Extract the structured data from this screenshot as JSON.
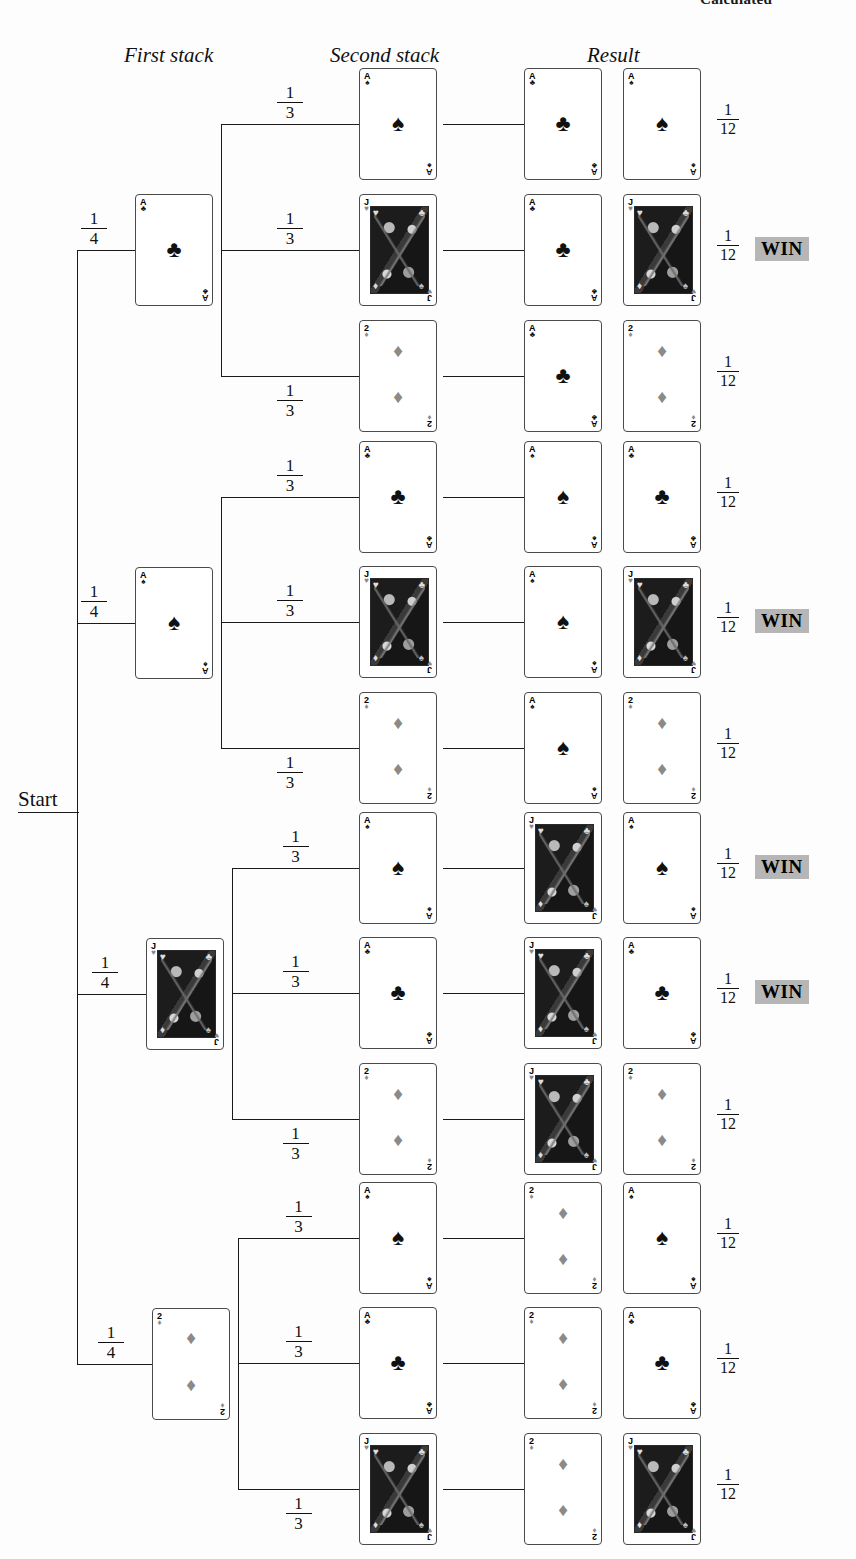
{
  "page_header": "Calculated",
  "columns": [
    {
      "label": "First stack",
      "x": 124,
      "y": 43
    },
    {
      "label": "Second stack",
      "x": 330,
      "y": 43
    },
    {
      "label": "Result",
      "x": 587,
      "y": 43
    }
  ],
  "start": {
    "label": "Start",
    "x": 18,
    "y": 787
  },
  "suits": {
    "spade": "♠",
    "club": "♣",
    "heart": "♥",
    "diamond": "♦"
  },
  "win": {
    "label": "WIN",
    "color": "#b6b6b6"
  },
  "branch_probability": {
    "numerator": "1",
    "denominator": "4"
  },
  "second_probability": {
    "numerator": "1",
    "denominator": "3"
  },
  "outcome_probability": {
    "numerator": "1",
    "denominator": "12"
  },
  "tree": {
    "total_outcomes": 12,
    "branches": [
      {
        "first_card": {
          "rank": "A",
          "suit": "club",
          "color": "black"
        },
        "probability": "1/4",
        "first_card_pos": {
          "x": 135,
          "y": 197
        },
        "prob_pos": {
          "x": 80,
          "y": 207
        },
        "children": [
          {
            "second_card": {
              "rank": "A",
              "suit": "spade",
              "color": "black"
            },
            "probability": "1/3",
            "result": [
              {
                "rank": "A",
                "suit": "club",
                "color": "black"
              },
              {
                "rank": "A",
                "suit": "spade",
                "color": "black"
              }
            ],
            "outcome_probability": "1/12",
            "win": false,
            "row_y": 68
          },
          {
            "second_card": {
              "rank": "J",
              "suit": "heart",
              "color": "face"
            },
            "probability": "1/3",
            "result": [
              {
                "rank": "A",
                "suit": "club",
                "color": "black"
              },
              {
                "rank": "J",
                "suit": "heart",
                "color": "face"
              }
            ],
            "outcome_probability": "1/12",
            "win": true,
            "row_y": 194
          },
          {
            "second_card": {
              "rank": "2",
              "suit": "diamond",
              "color": "gray"
            },
            "probability": "1/3",
            "result": [
              {
                "rank": "A",
                "suit": "club",
                "color": "black"
              },
              {
                "rank": "2",
                "suit": "diamond",
                "color": "gray"
              }
            ],
            "outcome_probability": "1/12",
            "win": false,
            "row_y": 320
          }
        ]
      },
      {
        "first_card": {
          "rank": "A",
          "suit": "spade",
          "color": "black"
        },
        "probability": "1/4",
        "first_card_pos": {
          "x": 135,
          "y": 568
        },
        "prob_pos": {
          "x": 80,
          "y": 578
        },
        "children": [
          {
            "second_card": {
              "rank": "A",
              "suit": "club",
              "color": "black"
            },
            "probability": "1/3",
            "result": [
              {
                "rank": "A",
                "suit": "spade",
                "color": "black"
              },
              {
                "rank": "A",
                "suit": "club",
                "color": "black"
              }
            ],
            "outcome_probability": "1/12",
            "win": false,
            "row_y": 441
          },
          {
            "second_card": {
              "rank": "J",
              "suit": "heart",
              "color": "face"
            },
            "probability": "1/3",
            "result": [
              {
                "rank": "A",
                "suit": "spade",
                "color": "black"
              },
              {
                "rank": "J",
                "suit": "heart",
                "color": "face"
              }
            ],
            "outcome_probability": "1/12",
            "win": true,
            "row_y": 566
          },
          {
            "second_card": {
              "rank": "2",
              "suit": "diamond",
              "color": "gray"
            },
            "probability": "1/3",
            "result": [
              {
                "rank": "A",
                "suit": "spade",
                "color": "black"
              },
              {
                "rank": "2",
                "suit": "diamond",
                "color": "gray"
              }
            ],
            "outcome_probability": "1/12",
            "win": false,
            "row_y": 692
          }
        ]
      },
      {
        "first_card": {
          "rank": "J",
          "suit": "heart",
          "color": "face"
        },
        "probability": "1/4",
        "first_card_pos": {
          "x": 146,
          "y": 938
        },
        "prob_pos": {
          "x": 185,
          "y": 948
        },
        "children": [
          {
            "second_card": {
              "rank": "A",
              "suit": "spade",
              "color": "black"
            },
            "probability": "1/3",
            "result": [
              {
                "rank": "J",
                "suit": "heart",
                "color": "face"
              },
              {
                "rank": "A",
                "suit": "spade",
                "color": "black"
              }
            ],
            "outcome_probability": "1/12",
            "win": true,
            "row_y": 812
          },
          {
            "second_card": {
              "rank": "A",
              "suit": "club",
              "color": "black"
            },
            "probability": "1/3",
            "result": [
              {
                "rank": "J",
                "suit": "heart",
                "color": "face"
              },
              {
                "rank": "A",
                "suit": "club",
                "color": "black"
              }
            ],
            "outcome_probability": "1/12",
            "win": true,
            "row_y": 937
          },
          {
            "second_card": {
              "rank": "2",
              "suit": "diamond",
              "color": "gray"
            },
            "probability": "1/3",
            "result": [
              {
                "rank": "J",
                "suit": "heart",
                "color": "face"
              },
              {
                "rank": "2",
                "suit": "diamond",
                "color": "gray"
              }
            ],
            "outcome_probability": "1/12",
            "win": false,
            "row_y": 1063
          }
        ]
      },
      {
        "first_card": {
          "rank": "2",
          "suit": "diamond",
          "color": "gray"
        },
        "probability": "1/4",
        "first_card_pos": {
          "x": 152,
          "y": 1281
        },
        "prob_pos": {
          "x": 105,
          "y": 1291
        },
        "children": [
          {
            "second_card": {
              "rank": "A",
              "suit": "spade",
              "color": "black"
            },
            "probability": "1/3",
            "result": [
              {
                "rank": "2",
                "suit": "diamond",
                "color": "gray"
              },
              {
                "rank": "A",
                "suit": "spade",
                "color": "black"
              }
            ],
            "outcome_probability": "1/12",
            "win": false,
            "row_y": 1182
          },
          {
            "second_card": {
              "rank": "A",
              "suit": "club",
              "color": "black"
            },
            "probability": "1/3",
            "result": [
              {
                "rank": "2",
                "suit": "diamond",
                "color": "gray"
              },
              {
                "rank": "A",
                "suit": "club",
                "color": "black"
              }
            ],
            "outcome_probability": "1/12",
            "win": false,
            "row_y": 1307
          },
          {
            "second_card": {
              "rank": "J",
              "suit": "heart",
              "color": "face"
            },
            "probability": "1/3",
            "result": [
              {
                "rank": "2",
                "suit": "diamond",
                "color": "gray"
              },
              {
                "rank": "J",
                "suit": "heart",
                "color": "face"
              }
            ],
            "outcome_probability": "1/12",
            "win": false,
            "row_y": 1433
          }
        ]
      }
    ]
  }
}
